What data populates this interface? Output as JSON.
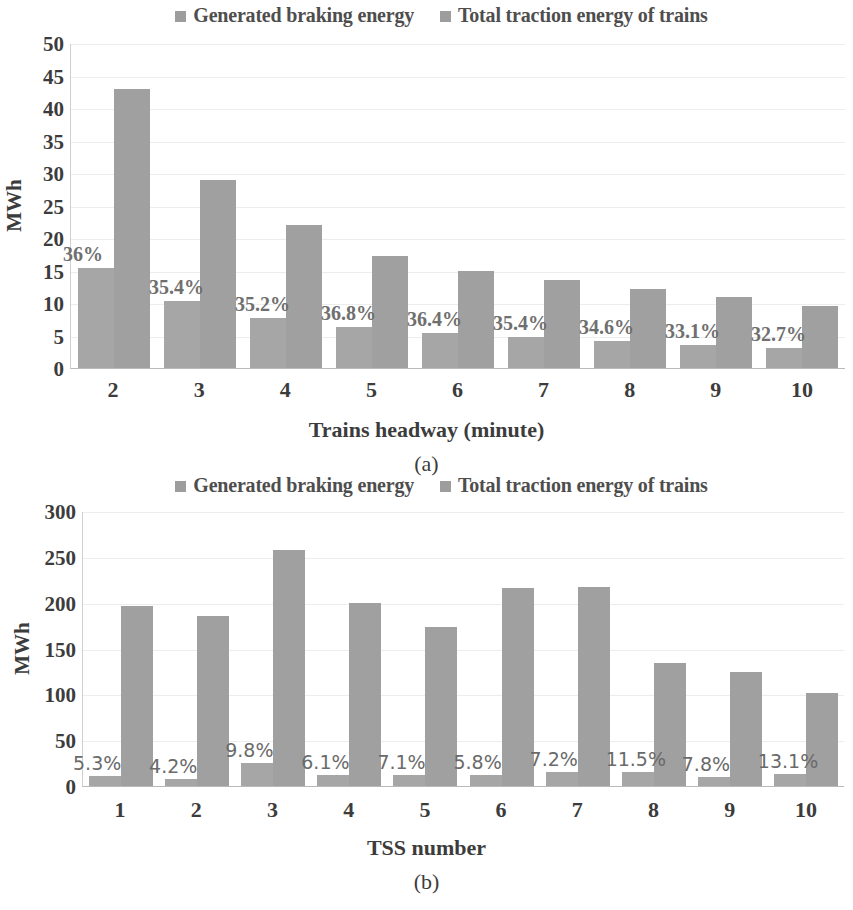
{
  "figure": {
    "legend": [
      {
        "label": "Generated braking energy",
        "color": "#a6a6a6",
        "icon": "square-swatch"
      },
      {
        "label": "Total traction energy of trains",
        "color": "#a0a0a0",
        "icon": "square-swatch"
      }
    ]
  },
  "chart_data": [
    {
      "type": "bar",
      "panel": "(a)",
      "title": "",
      "xlabel": "Trains headway (minute)",
      "ylabel": "MWh",
      "categories": [
        "2",
        "3",
        "4",
        "5",
        "6",
        "7",
        "8",
        "9",
        "10"
      ],
      "ylim": [
        0,
        50
      ],
      "yticks": [
        0,
        5,
        10,
        15,
        20,
        25,
        30,
        35,
        40,
        45,
        50
      ],
      "grid": true,
      "legend_position": "top-center",
      "series": [
        {
          "name": "Generated braking energy",
          "values": [
            15.4,
            10.3,
            7.7,
            6.3,
            5.4,
            4.8,
            4.2,
            3.6,
            3.1
          ]
        },
        {
          "name": "Total traction energy of trains",
          "values": [
            43.0,
            29.0,
            22.0,
            17.3,
            15.0,
            13.5,
            12.2,
            10.9,
            9.5
          ]
        }
      ],
      "annotations": [
        "36%",
        "35.4%",
        "35.2%",
        "36.8%",
        "36.4%",
        "35.4%",
        "34.6%",
        "33.1%",
        "32.7%"
      ]
    },
    {
      "type": "bar",
      "panel": "(b)",
      "title": "",
      "xlabel": "TSS number",
      "ylabel": "MWh",
      "categories": [
        "1",
        "2",
        "3",
        "4",
        "5",
        "6",
        "7",
        "8",
        "9",
        "10"
      ],
      "ylim": [
        0,
        300
      ],
      "yticks": [
        0,
        50,
        100,
        150,
        200,
        250,
        300
      ],
      "grid": true,
      "legend_position": "top-center",
      "series": [
        {
          "name": "Generated braking energy",
          "values": [
            10.4,
            7.8,
            25.3,
            12.2,
            12.3,
            12.5,
            15.6,
            15.4,
            9.7,
            13.4
          ]
        },
        {
          "name": "Total traction energy of trains",
          "values": [
            196,
            186,
            258,
            200,
            173,
            216,
            217,
            134,
            124,
            102
          ]
        }
      ],
      "annotations": [
        "5.3%",
        "4.2%",
        "9.8%",
        "6.1%",
        "7.1%",
        "5.8%",
        "7.2%",
        "11.5%",
        "7.8%",
        "13.1%"
      ]
    }
  ]
}
